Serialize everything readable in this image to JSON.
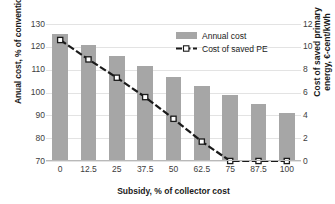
{
  "chart_data": {
    "type": "bar",
    "title": "",
    "categories": [
      "0",
      "12.5",
      "25",
      "37.5",
      "50",
      "62.5",
      "75",
      "87.5",
      "100"
    ],
    "xlabel": "Subsidy, % of collector cost",
    "ylabel": "Anual cost, % of conventional",
    "ylabel_secondary": "Cost of saved primary energy, €-cent/kWh",
    "ylim": [
      70,
      130
    ],
    "ylim_secondary": [
      0,
      12
    ],
    "yticks": [
      "130",
      "120",
      "110",
      "100",
      "90",
      "80",
      "70"
    ],
    "yticks_secondary": [
      "12",
      "10",
      "8",
      "6",
      "4",
      "2",
      "0"
    ],
    "grid": true,
    "legend_position": "upper-right",
    "series": [
      {
        "name": "Annual cost",
        "type": "bar",
        "axis": "left",
        "color": "#a6a6a6",
        "values": [
          125.5,
          121.0,
          116.0,
          111.5,
          107.0,
          103.0,
          99.0,
          95.0,
          91.0
        ]
      },
      {
        "name": "Cost of saved PE",
        "type": "line",
        "axis": "right",
        "color": "#1a1a1a",
        "style": "dashed",
        "marker": "white-square",
        "values": [
          10.6,
          8.9,
          7.3,
          5.6,
          3.7,
          1.7,
          0.0,
          0.0,
          0.0
        ]
      }
    ]
  },
  "legend": {
    "items": [
      {
        "label": "Annual cost",
        "swatch": "bar-swatch"
      },
      {
        "label": "Cost of saved PE",
        "swatch": "dashed-line-swatch"
      }
    ]
  },
  "axes": {
    "left_title": "Anual cost, % of conventional",
    "right_title_line1": "Cost of saved primary",
    "right_title_line2": "energy, €-cent/kWh",
    "bottom_title": "Subsidy, % of collector cost"
  },
  "colors": {
    "bar": "#a6a6a6",
    "line": "#1a1a1a",
    "grid": "#e3e3e3",
    "text": "#3d3d3d",
    "background": "#ffffff"
  }
}
